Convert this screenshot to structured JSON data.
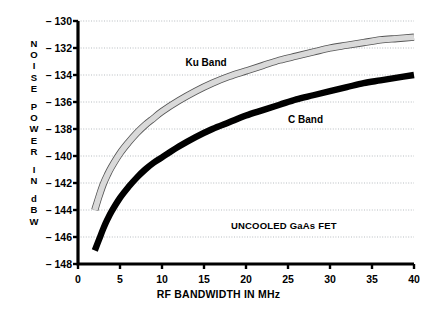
{
  "chart_data": {
    "type": "line",
    "title": "",
    "xlabel": "RF BANDWIDTH IN MHz",
    "ylabel": "NOISE POWER IN dBW",
    "ylabel_letters": [
      "N",
      "O",
      "I",
      "S",
      "E",
      "",
      "P",
      "O",
      "W",
      "E",
      "R",
      "",
      "I",
      "N",
      "",
      "d",
      "B",
      "W"
    ],
    "xlim": [
      0,
      40
    ],
    "ylim": [
      -148,
      -130
    ],
    "xticks": [
      0,
      5,
      10,
      15,
      20,
      25,
      30,
      35,
      40
    ],
    "xtick_labels": [
      "0",
      "5",
      "10",
      "15",
      "20",
      "25",
      "30",
      "35",
      "40"
    ],
    "yticks": [
      -130,
      -132,
      -134,
      -136,
      -138,
      -140,
      -142,
      -144,
      -146,
      -148
    ],
    "ytick_labels": [
      "– 130",
      "– 132",
      "– 134",
      "– 136",
      "– 138",
      "– 140",
      "– 142",
      "– 144",
      "– 146",
      "– 148"
    ],
    "grid": true,
    "grid_style": "dotted horizontal",
    "legend": "inline-labels",
    "annotations": [
      {
        "text": "UNCOOLED GaAs FET",
        "x": 24.5,
        "y": -145.2
      }
    ],
    "series": [
      {
        "name": "Ku Band",
        "color": "#d9d9d9",
        "outline": "#555555",
        "label_x": 12.8,
        "label_y": -133.1,
        "x": [
          2,
          2.5,
          3,
          3.5,
          4,
          5,
          6,
          7,
          8,
          9,
          10,
          12,
          14,
          16,
          18,
          20,
          22,
          24,
          26,
          28,
          30,
          32,
          34,
          36,
          38,
          40
        ],
        "y": [
          -144.0,
          -143.0,
          -142.1,
          -141.4,
          -140.8,
          -139.8,
          -139.0,
          -138.3,
          -137.7,
          -137.2,
          -136.7,
          -135.9,
          -135.2,
          -134.6,
          -134.1,
          -133.7,
          -133.3,
          -132.9,
          -132.6,
          -132.3,
          -132.0,
          -131.8,
          -131.6,
          -131.4,
          -131.3,
          -131.2
        ]
      },
      {
        "name": "C Band",
        "color": "#000000",
        "outline": "#000000",
        "label_x": 25.0,
        "label_y": -137.3,
        "x": [
          2,
          2.5,
          3,
          3.5,
          4,
          5,
          6,
          7,
          8,
          9,
          10,
          12,
          14,
          16,
          18,
          20,
          22,
          24,
          26,
          28,
          30,
          32,
          34,
          36,
          38,
          40
        ],
        "y": [
          -147.0,
          -146.2,
          -145.4,
          -144.7,
          -144.1,
          -143.1,
          -142.3,
          -141.6,
          -141.0,
          -140.5,
          -140.1,
          -139.3,
          -138.6,
          -138.0,
          -137.5,
          -137.0,
          -136.6,
          -136.2,
          -135.8,
          -135.5,
          -135.2,
          -134.9,
          -134.6,
          -134.4,
          -134.2,
          -134.0
        ]
      }
    ]
  }
}
